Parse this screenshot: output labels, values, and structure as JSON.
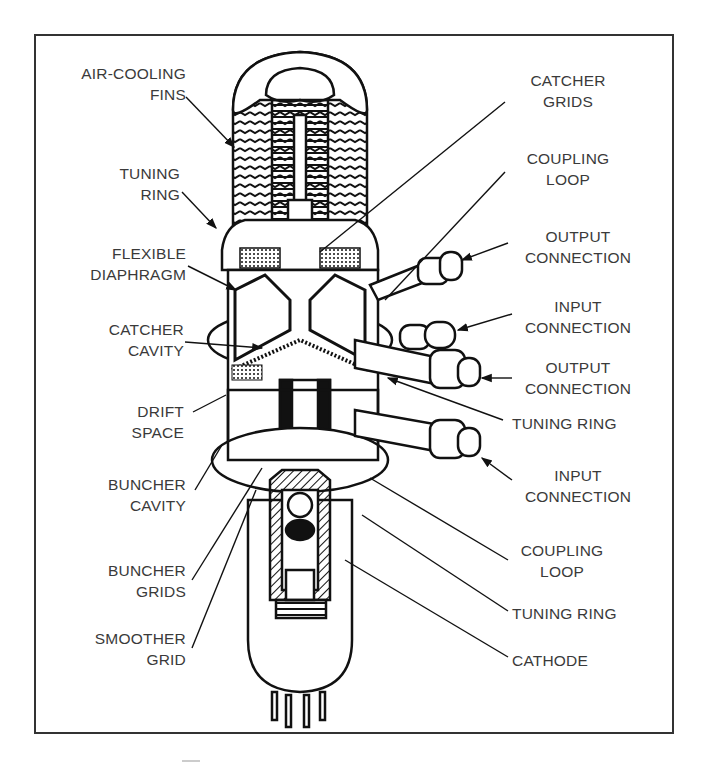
{
  "figure": {
    "labels_left": [
      {
        "id": "air-cooling-fins",
        "text": "AIR-COOLING\nFINS"
      },
      {
        "id": "tuning-ring-top",
        "text": "TUNING\nRING"
      },
      {
        "id": "flexible-diaphragm",
        "text": "FLEXIBLE\nDIAPHRAGM"
      },
      {
        "id": "catcher-cavity",
        "text": "CATCHER\nCAVITY"
      },
      {
        "id": "drift-space",
        "text": "DRIFT\nSPACE"
      },
      {
        "id": "buncher-cavity",
        "text": "BUNCHER\nCAVITY"
      },
      {
        "id": "buncher-grids",
        "text": "BUNCHER\nGRIDS"
      },
      {
        "id": "smoother-grid",
        "text": "SMOOTHER\nGRID"
      }
    ],
    "labels_right": [
      {
        "id": "catcher-grids",
        "text": "CATCHER\nGRIDS"
      },
      {
        "id": "coupling-loop-top",
        "text": "COUPLING\nLOOP"
      },
      {
        "id": "output-connection-top",
        "text": "OUTPUT\nCONNECTION"
      },
      {
        "id": "input-connection-top",
        "text": "INPUT\nCONNECTION"
      },
      {
        "id": "output-connection-mid",
        "text": "OUTPUT\nCONNECTION"
      },
      {
        "id": "tuning-ring-mid",
        "text": "TUNING RING"
      },
      {
        "id": "input-connection-bottom",
        "text": "INPUT\nCONNECTION"
      },
      {
        "id": "coupling-loop-bottom",
        "text": "COUPLING\nLOOP"
      },
      {
        "id": "tuning-ring-bottom",
        "text": "TUNING RING"
      },
      {
        "id": "cathode",
        "text": "CATHODE"
      }
    ]
  }
}
